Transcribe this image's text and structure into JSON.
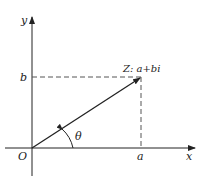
{
  "figure": {
    "axes": {
      "x_label": "x",
      "y_label": "y",
      "origin_label": "O"
    },
    "point": {
      "label": "Z: a+bi",
      "real_label": "a",
      "imag_label": "b"
    },
    "angle_label": "θ",
    "colors": {
      "line": "#222222",
      "dashed": "#555555",
      "background": "#ffffff"
    }
  }
}
